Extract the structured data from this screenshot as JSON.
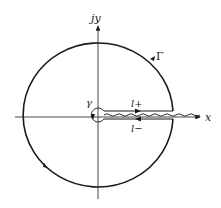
{
  "diagram": {
    "type": "contour-integration",
    "labels": {
      "y_axis": "jy",
      "x_axis": "x",
      "big_contour": "Γ",
      "small_contour": "γ",
      "upper_line": "l+",
      "lower_line": "l−"
    },
    "colors": {
      "stroke": "#1a1a1a",
      "background": "#ffffff"
    }
  }
}
